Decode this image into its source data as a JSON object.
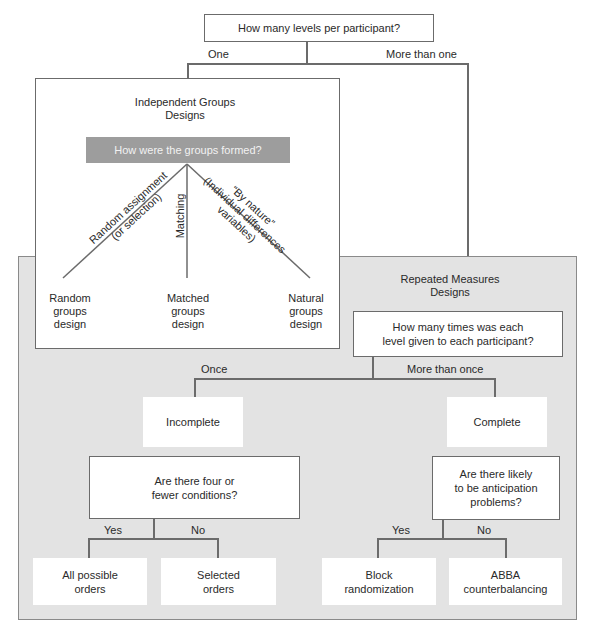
{
  "root": {
    "question": "How many levels per participant?",
    "branch_left": "One",
    "branch_right": "More than one"
  },
  "independent": {
    "title": "Independent Groups\nDesigns",
    "question": "How were the groups formed?",
    "branches": [
      {
        "label": "Random assignment\n(or selection)",
        "result": "Random\ngroups\ndesign"
      },
      {
        "label": "Matching",
        "result": "Matched\ngroups\ndesign"
      },
      {
        "label": "“By nature”\n(Individual differences\nvariables)",
        "result": "Natural\ngroups\ndesign"
      }
    ]
  },
  "repeated": {
    "title": "Repeated Measures\nDesigns",
    "question": "How many times was each\nlevel given to each participant?",
    "branch_left": "Once",
    "branch_right": "More than once",
    "incomplete": {
      "label": "Incomplete",
      "question": "Are there four or\nfewer conditions?",
      "yes": "Yes",
      "no": "No",
      "yes_result": "All possible\norders",
      "no_result": "Selected\norders"
    },
    "complete": {
      "label": "Complete",
      "question": "Are there likely\nto be anticipation\nproblems?",
      "yes": "Yes",
      "no": "No",
      "yes_result": "Block\nrandomization",
      "no_result": "ABBA\ncounterbalancing"
    }
  },
  "colors": {
    "line": "#6b6b6b",
    "region_gray": "#e3e3e3",
    "question_gray": "#9d9d9d"
  }
}
